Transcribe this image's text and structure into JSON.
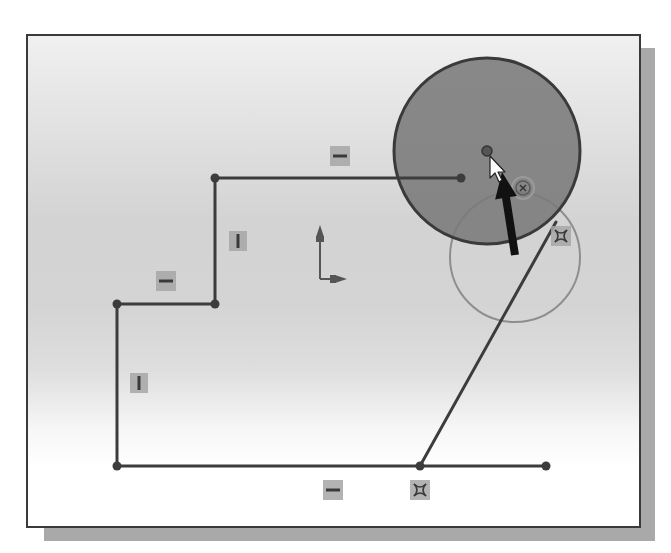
{
  "window": {
    "title": "",
    "kind": "cad-sketch-viewport"
  },
  "colors": {
    "sketch_line": "#3c3c3c",
    "filled_circle_fill": "#7a7a7a",
    "filled_circle_stroke": "#3a3a3a",
    "preview_circle_stroke": "#8e8e8e",
    "relation_icon_bg": "#a6a6a6",
    "relation_icon_glyph": "#3a3a3a",
    "pointer_arrow": "#111111",
    "cursor_fill": "#ffffff",
    "frame_border": "#3a3a3a",
    "frame_shadow": "#a9a9a9"
  },
  "sketch": {
    "lines": [
      {
        "name": "top-horizontal-line",
        "x1": 215,
        "y1": 178,
        "x2": 461,
        "y2": 178
      },
      {
        "name": "upper-vertical-line",
        "x1": 215,
        "y1": 178,
        "x2": 215,
        "y2": 304
      },
      {
        "name": "middle-horizontal-line",
        "x1": 117,
        "y1": 304,
        "x2": 215,
        "y2": 304
      },
      {
        "name": "left-vertical-line",
        "x1": 117,
        "y1": 304,
        "x2": 117,
        "y2": 466
      },
      {
        "name": "bottom-horizontal-line",
        "x1": 117,
        "y1": 466,
        "x2": 546,
        "y2": 466
      },
      {
        "name": "slanted-line",
        "x1": 420,
        "y1": 466,
        "x2": 556,
        "y2": 222
      }
    ],
    "endpoints": [
      {
        "x": 215,
        "y": 178
      },
      {
        "x": 461,
        "y": 178
      },
      {
        "x": 215,
        "y": 304
      },
      {
        "x": 117,
        "y": 304
      },
      {
        "x": 117,
        "y": 466
      },
      {
        "x": 420,
        "y": 466
      },
      {
        "x": 546,
        "y": 466
      }
    ],
    "filled_circle": {
      "cx": 487,
      "cy": 151,
      "r": 93
    },
    "circle_center_point": {
      "x": 487,
      "y": 151
    },
    "preview_circle": {
      "cx": 515,
      "cy": 257,
      "r": 65
    },
    "concentric_marker": {
      "x": 523,
      "y": 188
    },
    "origin_axis": {
      "x": 320,
      "y": 279,
      "up_len": 54,
      "right_len": 27
    },
    "pointer_arrow": {
      "x1": 515,
      "y1": 255,
      "x2": 502,
      "y2": 172
    },
    "mouse_cursor": {
      "x": 490,
      "y": 156
    }
  },
  "relations": [
    {
      "type": "horizontal",
      "icon": "horizontal-relation-icon",
      "x": 330,
      "y": 146
    },
    {
      "type": "vertical",
      "icon": "vertical-relation-icon",
      "x": 229,
      "y": 231
    },
    {
      "type": "horizontal",
      "icon": "horizontal-relation-icon",
      "x": 156,
      "y": 271
    },
    {
      "type": "vertical",
      "icon": "vertical-relation-icon",
      "x": 130,
      "y": 373
    },
    {
      "type": "horizontal",
      "icon": "horizontal-relation-icon",
      "x": 323,
      "y": 480
    },
    {
      "type": "coincident",
      "icon": "coincident-relation-icon",
      "x": 410,
      "y": 480
    },
    {
      "type": "coincident",
      "icon": "coincident-relation-icon",
      "x": 551,
      "y": 226
    }
  ]
}
